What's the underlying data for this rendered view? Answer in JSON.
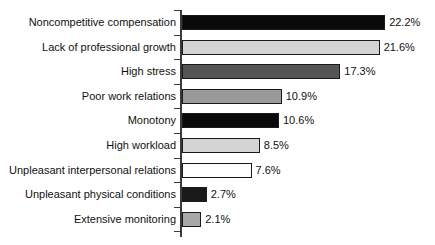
{
  "chart_data": {
    "type": "bar",
    "orientation": "horizontal",
    "title": "",
    "subtitle": "",
    "xlabel": "",
    "ylabel": "",
    "xlim": [
      0,
      22.2
    ],
    "grid": false,
    "legend": "none",
    "categories": [
      "Noncompetitive compensation",
      "Lack of professional growth",
      "High stress",
      "Poor work relations",
      "Monotony",
      "High workload",
      "Unpleasant interpersonal relations",
      "Unpleasant physical conditions",
      "Extensive monitoring"
    ],
    "values": [
      22.2,
      21.6,
      17.3,
      10.9,
      10.6,
      8.5,
      7.6,
      2.7,
      2.1
    ],
    "value_labels": [
      "22.2%",
      "21.6%",
      "17.3%",
      "10.9%",
      "10.6%",
      "8.5%",
      "7.6%",
      "2.7%",
      "2.1%"
    ],
    "bar_colors": [
      "#0a0a0a",
      "#d4d4d4",
      "#555555",
      "#9a9a9a",
      "#0a0a0a",
      "#d4d4d4",
      "#ffffff",
      "#1a1a1a",
      "#a8a8a8"
    ],
    "bar_outline_color": "#1a1a1a",
    "axis_color": "#3a3a3a",
    "background_color": "#ffffff",
    "text_color": "#111111"
  }
}
